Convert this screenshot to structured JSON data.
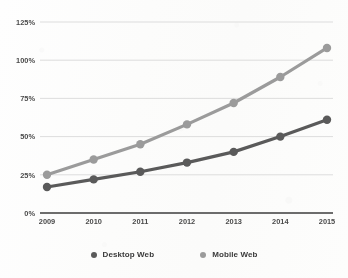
{
  "chart_data": {
    "type": "line",
    "title": "",
    "xlabel": "",
    "ylabel": "",
    "categories": [
      "2009",
      "2010",
      "2011",
      "2012",
      "2013",
      "2014",
      "2015"
    ],
    "x": [
      2009,
      2010,
      2011,
      2012,
      2013,
      2014,
      2015
    ],
    "ylim": [
      0,
      125
    ],
    "yticks": [
      0,
      25,
      50,
      75,
      100,
      125
    ],
    "ytick_labels": [
      "0%",
      "25%",
      "50%",
      "75%",
      "100%",
      "125%"
    ],
    "grid": true,
    "legend_position": "bottom",
    "series": [
      {
        "name": "Desktop Web",
        "color": "#5a5a5a",
        "values": [
          17,
          22,
          27,
          33,
          40,
          50,
          61
        ]
      },
      {
        "name": "Mobile Web",
        "color": "#9b9b9b",
        "values": [
          25,
          35,
          45,
          58,
          72,
          89,
          108
        ]
      }
    ]
  },
  "legend": {
    "items": [
      {
        "label": "Desktop Web",
        "color": "#5a5a5a",
        "swatch": "circle-marker-icon"
      },
      {
        "label": "Mobile Web",
        "color": "#9b9b9b",
        "swatch": "circle-marker-icon"
      }
    ]
  },
  "axes": {
    "y_labels": [
      "125%",
      "100%",
      "75%",
      "50%",
      "25%",
      "0%"
    ],
    "x_labels": [
      "2009",
      "2010",
      "2011",
      "2012",
      "2013",
      "2014",
      "2015"
    ],
    "axis_color": "#3c3c3c",
    "grid_color": "#d9d9d9"
  }
}
